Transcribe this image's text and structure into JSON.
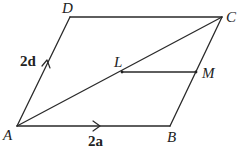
{
  "diagram": {
    "vertices": {
      "A": {
        "label": "A",
        "x": 17,
        "y": 126
      },
      "B": {
        "label": "B",
        "x": 170,
        "y": 126
      },
      "C": {
        "label": "C",
        "x": 222,
        "y": 17
      },
      "D": {
        "label": "D",
        "x": 70,
        "y": 17
      },
      "L": {
        "label": "L",
        "x": 122,
        "y": 72
      },
      "M": {
        "label": "M",
        "x": 196,
        "y": 72
      }
    },
    "edges": [
      {
        "from": "A",
        "to": "B",
        "vector_label": "2a",
        "arrow": true
      },
      {
        "from": "B",
        "to": "C",
        "arrow": false
      },
      {
        "from": "C",
        "to": "D",
        "arrow": false
      },
      {
        "from": "A",
        "to": "D",
        "vector_label": "2d",
        "arrow": true
      },
      {
        "from": "A",
        "to": "C",
        "arrow": false,
        "note": "diagonal"
      },
      {
        "from": "L",
        "to": "M",
        "arrow": false
      }
    ],
    "vector_labels": {
      "AB": "2a",
      "AD": "2d"
    },
    "cut_text": "Not drawn to scale"
  }
}
